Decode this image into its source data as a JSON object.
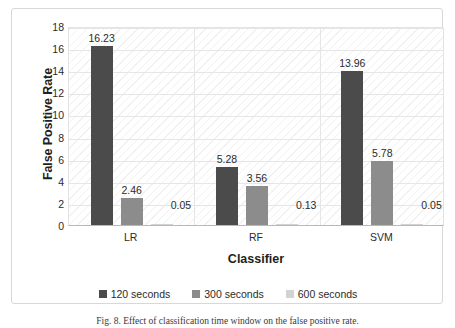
{
  "chart_data": {
    "type": "bar",
    "title": "",
    "xlabel": "Classifier",
    "ylabel": "False Positive Rate",
    "categories": [
      "LR",
      "RF",
      "SVM"
    ],
    "series": [
      {
        "name": "120 seconds",
        "color": "#4b4b4b",
        "values": [
          16.23,
          5.28,
          13.96
        ]
      },
      {
        "name": "300 seconds",
        "color": "#8c8c8c",
        "values": [
          2.46,
          3.56,
          5.78
        ]
      },
      {
        "name": "600 seconds",
        "color": "#d2d2d2",
        "values": [
          0.05,
          0.13,
          0.05
        ]
      }
    ],
    "value_labels": [
      [
        "16.23",
        "5.28",
        "13.96"
      ],
      [
        "2.46",
        "3.56",
        "5.78"
      ],
      [
        "0.05",
        "0.13",
        "0.05"
      ]
    ],
    "ylim": [
      0,
      18
    ],
    "yticks": [
      0,
      2,
      4,
      6,
      8,
      10,
      12,
      14,
      16,
      18
    ],
    "ytick_labels": [
      "0",
      "2",
      "4",
      "6",
      "8",
      "10",
      "12",
      "14",
      "16",
      "18"
    ],
    "grid": true,
    "legend_position": "bottom"
  },
  "legend": {
    "items": [
      {
        "label": "120 seconds",
        "color": "#4b4b4b"
      },
      {
        "label": "300 seconds",
        "color": "#8c8c8c"
      },
      {
        "label": "600 seconds",
        "color": "#d2d2d2"
      }
    ]
  },
  "caption": {
    "text": "Fig. 8.  Effect of classification time window on the false positive rate."
  }
}
